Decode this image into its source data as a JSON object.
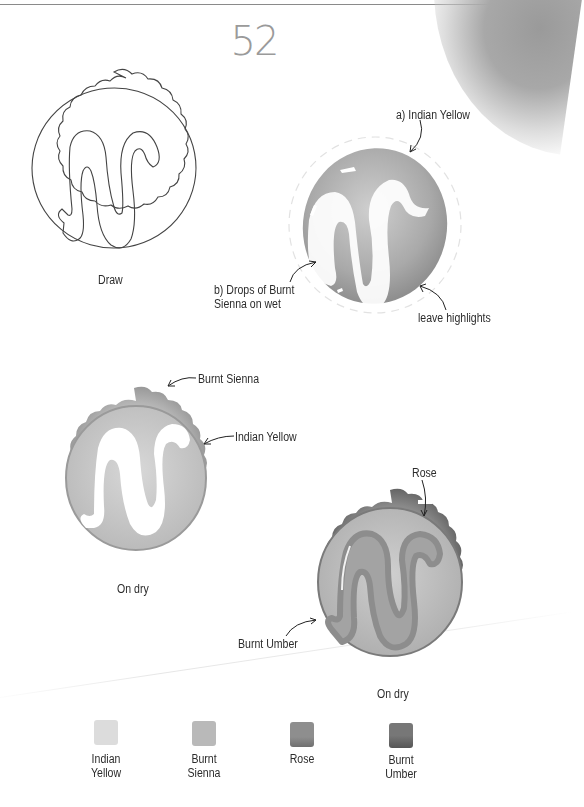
{
  "page": {
    "number": "52",
    "background": "#ffffff"
  },
  "steps": [
    {
      "id": "step-1",
      "caption": "Draw",
      "style": "line-drawing",
      "annotations": []
    },
    {
      "id": "step-2",
      "caption": "",
      "style": "watercolor-wash",
      "annotations": [
        {
          "text": "a) Indian Yellow"
        },
        {
          "line1": "b) Drops of Burnt",
          "line2": "Sienna on wet"
        },
        {
          "text": "leave highlights"
        }
      ]
    },
    {
      "id": "step-3",
      "caption": "On dry",
      "style": "watercolor-crust",
      "annotations": [
        {
          "text": "Burnt Sienna"
        },
        {
          "text": "Indian Yellow"
        }
      ]
    },
    {
      "id": "step-4",
      "caption": "On dry",
      "style": "watercolor-final",
      "annotations": [
        {
          "text": "Rose"
        },
        {
          "text": "Burnt Umber"
        }
      ]
    }
  ],
  "palette": [
    {
      "line1": "Indian",
      "line2": "Yellow",
      "color": "#dcdcdc"
    },
    {
      "line1": "Burnt",
      "line2": "Sienna",
      "color": "#b9b9b9"
    },
    {
      "line1": "Rose",
      "line2": "",
      "color": "#8a8a8a"
    },
    {
      "line1": "Burnt",
      "line2": "Umber",
      "color": "#6e6e6e"
    }
  ]
}
